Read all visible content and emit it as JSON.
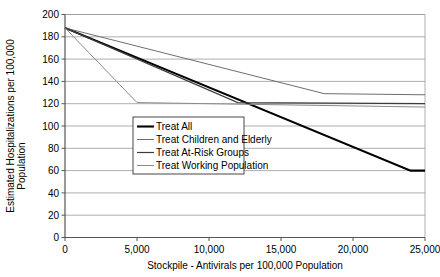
{
  "chart_data": {
    "type": "line",
    "title": "",
    "xlabel": "Stockpile - Antivirals per 100,000 Population",
    "ylabel_line1": "Estimated Hospitalizations per 100,000",
    "ylabel_line2": "Population",
    "xlim": [
      0,
      25000
    ],
    "ylim": [
      0,
      200
    ],
    "xticks": [
      0,
      5000,
      10000,
      15000,
      20000,
      25000
    ],
    "xtick_labels": [
      "0",
      "5,000",
      "10,000",
      "15,000",
      "20,000",
      "25,000"
    ],
    "yticks": [
      0,
      20,
      40,
      60,
      80,
      100,
      120,
      140,
      160,
      180,
      200
    ],
    "ytick_labels": [
      "0",
      "20",
      "40",
      "60",
      "80",
      "100",
      "120",
      "140",
      "160",
      "180",
      "200"
    ],
    "grid": true,
    "grid_axis": "y",
    "legend_position": "center",
    "series": [
      {
        "name": "Treat All",
        "color": "#000000",
        "width": 2.1,
        "points": [
          [
            0,
            188
          ],
          [
            24000,
            60
          ],
          [
            25000,
            60
          ]
        ]
      },
      {
        "name": "Treat Children and Elderly",
        "color": "#6e6e6e",
        "width": 1.0,
        "points": [
          [
            0,
            188
          ],
          [
            18000,
            129
          ],
          [
            25000,
            128
          ]
        ]
      },
      {
        "name": "Treat At-Risk Groups",
        "color": "#3c3c3c",
        "width": 1.2,
        "points": [
          [
            0,
            188
          ],
          [
            12000,
            121
          ],
          [
            25000,
            120
          ]
        ]
      },
      {
        "name": "Treat Working Population",
        "color": "#8a8a8a",
        "width": 1.0,
        "points": [
          [
            0,
            188
          ],
          [
            5000,
            121
          ],
          [
            25000,
            117
          ]
        ]
      }
    ]
  },
  "legend": {
    "items": [
      {
        "label": "Treat All"
      },
      {
        "label": "Treat Children and Elderly"
      },
      {
        "label": "Treat At-Risk Groups"
      },
      {
        "label": "Treat Working Population"
      }
    ]
  }
}
